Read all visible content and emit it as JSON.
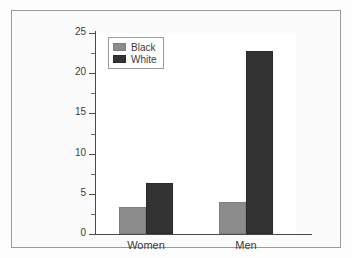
{
  "chart_data": {
    "type": "bar",
    "title": "",
    "subtitle": "",
    "xlabel": "",
    "ylabel": "",
    "categories": [
      "Women",
      "Men"
    ],
    "series": [
      {
        "name": "Black",
        "color": "#8c8c8c",
        "values": [
          3.3,
          4.0
        ]
      },
      {
        "name": "White",
        "color": "#333333",
        "values": [
          6.3,
          22.8
        ]
      }
    ],
    "ylim": [
      0,
      25
    ],
    "y_ticks": [
      0,
      5,
      10,
      15,
      20,
      25
    ],
    "y_tick_labels": [
      "0",
      "5",
      "10",
      "15",
      "20",
      "25"
    ],
    "y_minor_ticks": [
      2.5,
      7.5,
      12.5,
      17.5,
      22.5
    ],
    "grid": false,
    "legend_position": "upper left",
    "legend_entries": [
      "Black",
      "White"
    ]
  },
  "figure": {
    "frame_color": "#9a9a9a",
    "background_color": "#fbfbfb",
    "plot_background_color": "#ffffff",
    "axis_color": "#4a4a4a"
  }
}
